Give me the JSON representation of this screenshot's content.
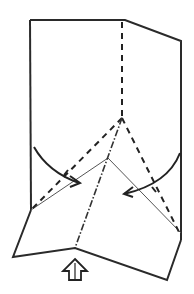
{
  "diagram": {
    "type": "origami-fold-diagram",
    "colors": {
      "line": "#2a2a2a",
      "background": "#ffffff"
    },
    "shapes": {
      "outline": "30,20 125,20 181,41 181,240",
      "left_edge": "30,20 31,210",
      "bottom_flap": "31,210 13,257 75,248 167,280 181,240",
      "inner_thin_lines": [
        "31,210 108,158 181,233"
      ],
      "valley_folds": [
        "122,22 122,118",
        "122,118 31,210",
        "122,118 181,236"
      ],
      "mountain_folds": [
        "122,118 75,248"
      ]
    },
    "arrows": [
      {
        "name": "fold-left-arrow",
        "direction": "curved-right-down"
      },
      {
        "name": "fold-right-arrow",
        "direction": "curved-left-down"
      },
      {
        "name": "push-up-arrow",
        "direction": "up",
        "style": "outlined"
      }
    ]
  }
}
